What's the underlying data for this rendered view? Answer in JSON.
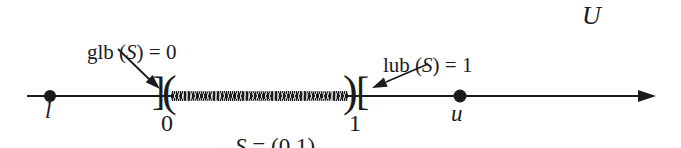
{
  "universe_label": "U",
  "annotations": {
    "glb": {
      "prefix": "glb (",
      "variable": "S",
      "suffix": ") = 0"
    },
    "lub": {
      "prefix": "lub (",
      "variable": "S",
      "suffix": ") = 1"
    }
  },
  "interval": {
    "label": {
      "variable": "S",
      "rest": " = (0,1)"
    },
    "endpoint_zero": {
      "tick": "0",
      "lower_bounds_close_bracket": "]",
      "open_paren": "("
    },
    "endpoint_one": {
      "tick": "1",
      "close_paren": ")",
      "upper_bounds_open_bracket": "["
    }
  },
  "points": {
    "lower_bound": "l",
    "upper_bound": "u"
  },
  "colors": {
    "ink": "#1b1b1b",
    "background": "#ffffff"
  }
}
